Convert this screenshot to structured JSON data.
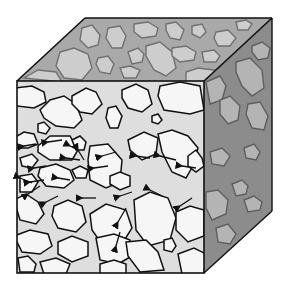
{
  "figure": {
    "title": "Porous medium cube with flow paths",
    "colors": {
      "background": "#ffffff",
      "top_face": "#a9a9a9",
      "top_grain": "#cdcdcd",
      "side_face": "#8c8c8c",
      "side_grain": "#b4b4b4",
      "front_matrix": "#dedede",
      "front_grain": "#f6f6f6",
      "outline": "#111111",
      "grain_outline_muted": "#707070"
    },
    "faces": [
      "front",
      "top",
      "right-side"
    ],
    "flow_direction": "right-to-left",
    "arrow_count": 22
  }
}
